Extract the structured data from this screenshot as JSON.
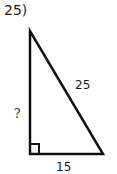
{
  "problem": {
    "number": "25)",
    "hypotenuse_label": "25",
    "leg_vertical_label": "?",
    "leg_horizontal_label": "15",
    "right_angle": true
  }
}
